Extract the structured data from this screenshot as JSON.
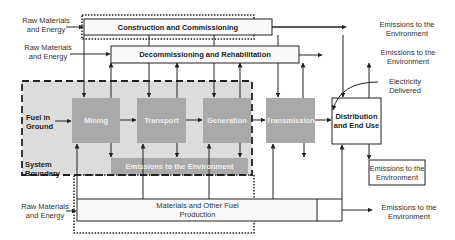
{
  "diagram": {
    "colors": {
      "system_boundary_fill": "#dcdcdc",
      "process_box_fill": "#a9a9a9",
      "line": "#222222"
    },
    "inputs": {
      "raw_materials_top_1": "Raw Materials and Energy",
      "raw_materials_top_2": "Raw Materials and Energy",
      "raw_materials_bottom": "Raw Materials and Energy",
      "fuel_in_ground": "Fuel in Ground"
    },
    "boxes": {
      "construction": "Construction and Commissioning",
      "decommissioning": "Decommissioning and Rehabilitation",
      "mining": "Mining",
      "transport": "Transport",
      "generation": "Generation",
      "transmission": "Transmission",
      "emissions_inner": "Emissions to the Environment",
      "distribution": "Distribution and End Use",
      "materials": "Materials and Other Fuel Production",
      "emissions_box": "Emissions to the Environment"
    },
    "outputs": {
      "emissions_1": "Emissions to the Environment",
      "emissions_2": "Emissions to the Environment",
      "electricity": "Electricity Delivered",
      "emissions_bottom": "Emissions to the Environment"
    },
    "system_boundary_label": "System Boundary"
  }
}
